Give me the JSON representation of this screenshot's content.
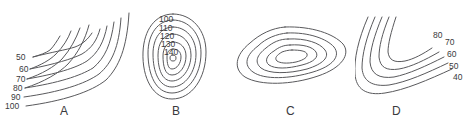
{
  "figure": {
    "type": "contour-map-diagram",
    "background_color": "#ffffff",
    "line_color": "#59595c",
    "text_color": "#3a3a3d",
    "panels": [
      {
        "letter": "A",
        "shape": "nested-hairpin-ridge",
        "label_side": "left",
        "contour_labels": [
          "50",
          "60",
          "70",
          "80",
          "90",
          "100"
        ]
      },
      {
        "letter": "B",
        "shape": "concentric-closed-rings",
        "label_side": "top-inside",
        "contour_labels": [
          "100",
          "110",
          "120",
          "130",
          "140"
        ]
      },
      {
        "letter": "C",
        "shape": "nested-elongated-ovals",
        "label_side": "none",
        "contour_labels": []
      },
      {
        "letter": "D",
        "shape": "nested-v-valley",
        "label_side": "right",
        "contour_labels": [
          "80",
          "70",
          "60",
          "50",
          "40"
        ]
      }
    ]
  }
}
